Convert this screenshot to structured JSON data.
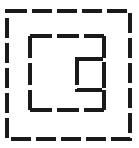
{
  "figure": {
    "canvas": {
      "width": 139,
      "height": 148,
      "background": "#ffffff"
    },
    "stroke": {
      "color": "#1a1a1a",
      "width": 3.2,
      "linecap": "butt"
    },
    "shapes": [
      {
        "name": "outer-square",
        "label": "Outer dashed square",
        "x": 7,
        "y": 11,
        "width": 123,
        "height": 128,
        "dash": "20 5",
        "dash_offset": 0
      },
      {
        "name": "middle-square",
        "label": "Middle dashed square with right-side notch",
        "x": 30,
        "y": 36,
        "width": 74,
        "height": 74,
        "dash": "22 5",
        "dash_offset": 0,
        "notch": {
          "name": "middle-square-notch",
          "label": "gap in right edge",
          "edge": "right",
          "start_y": 59,
          "end_y": 90
        }
      },
      {
        "name": "inner-square",
        "label": "Small dashed square",
        "x": 77,
        "y": 59,
        "width": 27,
        "height": 31,
        "dash": "26 4",
        "dash_offset": 0
      }
    ]
  }
}
